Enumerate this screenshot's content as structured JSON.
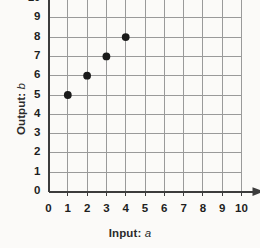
{
  "chart_data": {
    "type": "scatter",
    "title": "",
    "xlabel": "Input: a",
    "ylabel": "Output: b",
    "xlabel_prefix": "Input:",
    "xlabel_variable": "a",
    "ylabel_prefix": "Output:",
    "ylabel_variable": "b",
    "xlim": [
      0,
      10
    ],
    "ylim": [
      0,
      10
    ],
    "xticks": [
      0,
      1,
      2,
      3,
      4,
      5,
      6,
      7,
      8,
      9,
      10
    ],
    "yticks": [
      0,
      1,
      2,
      3,
      4,
      5,
      6,
      7,
      8,
      9,
      10
    ],
    "xtick_labels": [
      "0",
      "1",
      "2",
      "3",
      "4",
      "5",
      "6",
      "7",
      "8",
      "9",
      "10"
    ],
    "ytick_labels": [
      "0",
      "1",
      "2",
      "3",
      "4",
      "5",
      "6",
      "7",
      "8",
      "9",
      "10"
    ],
    "grid": true,
    "legend": false,
    "points": [
      {
        "x": 1,
        "y": 5
      },
      {
        "x": 2,
        "y": 6
      },
      {
        "x": 3,
        "y": 7
      },
      {
        "x": 4,
        "y": 8
      }
    ],
    "colors": {
      "point": "#1a1a1a",
      "axis": "#3c3c3c",
      "grid": "#9a9a9a",
      "background": "#fbfaf8",
      "text": "#1e1e1e"
    }
  }
}
